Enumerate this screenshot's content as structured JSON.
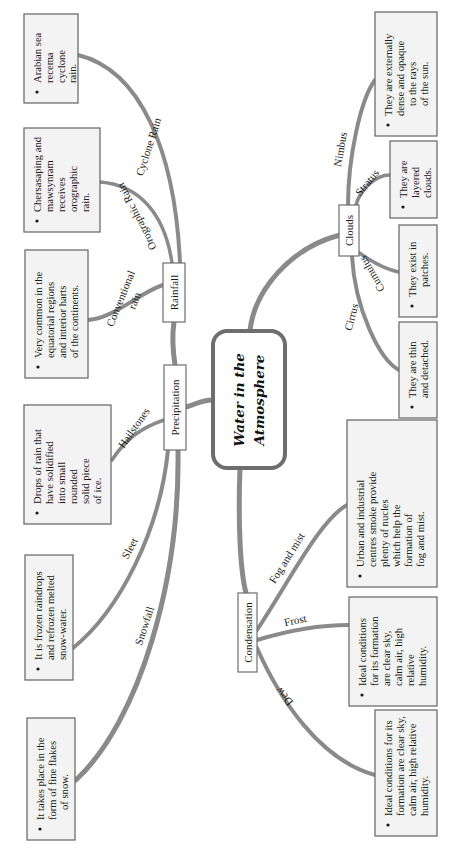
{
  "central": {
    "line1": "Water in the",
    "line2": "Atmosphere"
  },
  "nodes": {
    "precipitation": "Precipitation",
    "rainfall": "Rainfall",
    "clouds": "Clouds",
    "condensation": "Condensation"
  },
  "branch_labels": {
    "cyclone_rain": "Cyclone Rain",
    "orographic_rain": "Orographic Rain",
    "conventional_rain_1": "Conventional",
    "conventional_rain_2": "rain",
    "hailstones": "Hailstones",
    "sleet": "Sleet",
    "snowfall": "Snowfall",
    "nimbus": "Nimbus",
    "stratus": "Stratus",
    "cumulus": "Cumulus",
    "cirrus": "Cirrus",
    "fog_and_mist": "Fog and mist",
    "frost": "Frost",
    "dew": "Dew"
  },
  "boxes": {
    "cyclone": [
      "Arabian sea",
      "recema",
      "cyclone",
      "rain."
    ],
    "orographic": [
      "Chersasaping and",
      "mawsynram",
      "receives",
      "orographic",
      "rain."
    ],
    "conventional": [
      "Very common in the",
      "equatorial regions",
      "and interior harts",
      "of the continents."
    ],
    "hailstones": [
      "Drops of rain that",
      "have solidified",
      "into small",
      "rounded",
      "solid piece",
      "of ice."
    ],
    "sleet": [
      "It is frozen raindrops",
      "and refrozen melted",
      "snow-water."
    ],
    "snowfall": [
      "It takes place in the",
      "form of fine flakes",
      "of snow."
    ],
    "nimbus": [
      "They are externally",
      "dense and opaque",
      "to the rays",
      "of the sun."
    ],
    "stratus": [
      "They are",
      "layered",
      "clouds."
    ],
    "cumulus": [
      "They exist in",
      "patches."
    ],
    "cirrus": [
      "They are thin",
      "and detached."
    ],
    "fog": [
      "Urban and industrial",
      "centres smoke provide",
      "plenty of nucles",
      "which help the",
      "formation of",
      "fog and mist."
    ],
    "frost": [
      "Ideal conditions",
      "for its formation",
      "are clear sky,",
      "calm air, high",
      "relative",
      "humidity."
    ],
    "dew": [
      "Ideal conditions for its",
      "formation are clear sky,",
      "calm air, high relative",
      "humidity."
    ]
  },
  "colors": {
    "branch": "#8a8a8a",
    "box_fill": "#f3f3f3",
    "box_border": "#6e6e6e"
  }
}
